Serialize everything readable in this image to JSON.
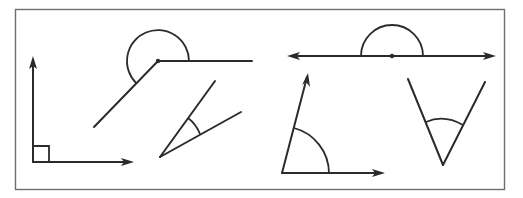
{
  "figure": {
    "type": "angle-types-illustration",
    "stroke_color": "#2b2b2b",
    "frame_color": "#6e6e6e",
    "background": "#ffffff",
    "angles": [
      {
        "id": "right-angle",
        "kind": "right",
        "vertex": [
          33,
          162
        ],
        "marker": "square"
      },
      {
        "id": "reflex-angle",
        "kind": "reflex",
        "vertex": [
          158,
          61
        ],
        "marker": "arc"
      },
      {
        "id": "acute-angle-small",
        "kind": "acute",
        "vertex": [
          160,
          157
        ],
        "marker": "arc"
      },
      {
        "id": "straight-angle",
        "kind": "straight",
        "vertex": [
          392,
          56
        ],
        "marker": "semicircle"
      },
      {
        "id": "acute-angle-arrow",
        "kind": "acute",
        "vertex": [
          282,
          173
        ],
        "marker": "arc"
      },
      {
        "id": "acute-angle-v",
        "kind": "acute",
        "vertex": [
          443,
          165
        ],
        "marker": "arc"
      }
    ]
  }
}
